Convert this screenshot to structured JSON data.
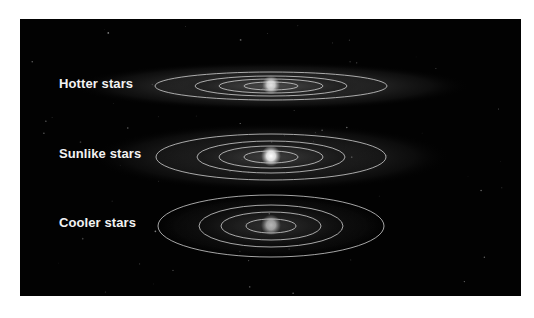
{
  "figure": {
    "systems": [
      {
        "label": "Hotter stars",
        "center": [
          251,
          67
        ],
        "disk": {
          "rx": 200,
          "ry": 24,
          "opacity": 0.55
        },
        "orbits": [
          [
            116,
            14
          ],
          [
            76,
            10
          ],
          [
            52,
            7
          ],
          [
            27,
            4
          ]
        ],
        "star": {
          "r": 9,
          "brightness": 0.85
        }
      },
      {
        "label": "Sunlike stars",
        "center": [
          251,
          138
        ],
        "disk": {
          "rx": 180,
          "ry": 34,
          "opacity": 0.45
        },
        "orbits": [
          [
            115,
            23
          ],
          [
            74,
            16
          ],
          [
            52,
            11
          ],
          [
            27,
            6
          ]
        ],
        "star": {
          "r": 10,
          "brightness": 1.0
        }
      },
      {
        "label": "Cooler stars",
        "center": [
          251,
          207
        ],
        "disk": {
          "rx": 120,
          "ry": 32,
          "opacity": 0.35
        },
        "orbits": [
          [
            113,
            31
          ],
          [
            72,
            21
          ],
          [
            50,
            14
          ],
          [
            25,
            7
          ]
        ],
        "star": {
          "r": 10,
          "brightness": 0.65
        }
      }
    ],
    "colors": {
      "background": "#020202",
      "page": "#ffffff",
      "orbit": "#d8d8d8",
      "label": "#f2f2f2"
    }
  }
}
